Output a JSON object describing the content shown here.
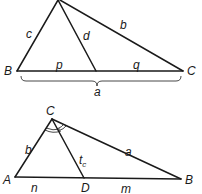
{
  "diagrams": {
    "top": {
      "description": "Triangle with cevian d from apex to side a, splitting it into p and q",
      "vertices": {
        "B": "B",
        "C": "C"
      },
      "sides": {
        "c": "c",
        "b": "b",
        "d": "d",
        "p": "p",
        "q": "q",
        "a": "a"
      }
    },
    "bottom": {
      "description": "Triangle ABC with angle bisector t_c from C to D on AB, splitting AB into n and m",
      "vertices": {
        "A": "A",
        "B": "B",
        "C": "C",
        "D": "D"
      },
      "sides": {
        "b": "b",
        "a": "a",
        "n": "n",
        "m": "m"
      },
      "bisector": {
        "main": "t",
        "subscript": "c"
      }
    }
  },
  "colors": {
    "stroke": "#1a1a1a",
    "background": "#ffffff"
  }
}
